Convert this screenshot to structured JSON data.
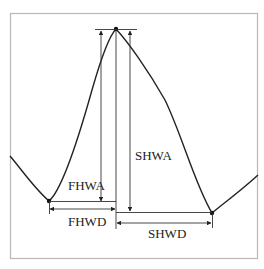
{
  "diagram": {
    "type": "waveform-measurement",
    "frame": {
      "x": 10,
      "y": 13,
      "width": 248,
      "height": 246,
      "stroke": "#b8b8b8"
    },
    "colors": {
      "curve": "#222222",
      "annotation": "#333333",
      "frame": "#b8b8b8",
      "background": "#ffffff"
    },
    "points": {
      "left_start": [
        10,
        156
      ],
      "left_valley": [
        49,
        201
      ],
      "peak": [
        116,
        29
      ],
      "right_valley": [
        212,
        213
      ],
      "right_end": [
        258,
        175
      ]
    },
    "labels": {
      "fhwa": "FHWA",
      "fhwd": "FHWD",
      "shwa": "SHWA",
      "shwd": "SHWD"
    },
    "label_positions": {
      "fhwa": [
        68,
        190
      ],
      "fhwd": [
        68,
        226
      ],
      "shwa": [
        135,
        160
      ],
      "shwd": [
        148,
        238
      ]
    }
  }
}
